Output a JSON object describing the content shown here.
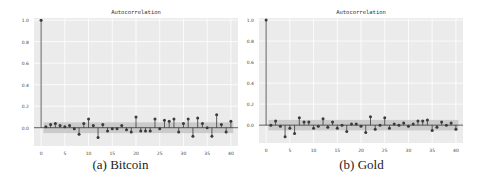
{
  "figure": {
    "captions": [
      "(a) Bitcoin",
      "(b) Gold"
    ]
  },
  "chart_data": [
    {
      "type": "stem",
      "title": "Autocorrelation",
      "caption": "(a) Bitcoin",
      "xlabel": "",
      "ylabel": "",
      "xlim": [
        -1.5,
        41.5
      ],
      "ylim": [
        -0.17,
        1.02
      ],
      "xticks": [
        0,
        5,
        10,
        15,
        20,
        25,
        30,
        35,
        40
      ],
      "yticks": [
        0.0,
        0.2,
        0.4,
        0.6,
        0.8,
        1.0
      ],
      "ytick_labels": [
        "0.0",
        "0.2",
        "0.4",
        "0.6",
        "0.8",
        "1.0"
      ],
      "grid": true,
      "confidence_band": [
        -0.05,
        0.05
      ],
      "x": [
        0,
        1,
        2,
        3,
        4,
        5,
        6,
        7,
        8,
        9,
        10,
        11,
        12,
        13,
        14,
        15,
        16,
        17,
        18,
        19,
        20,
        21,
        22,
        23,
        24,
        25,
        26,
        27,
        28,
        29,
        30,
        31,
        32,
        33,
        34,
        35,
        36,
        37,
        38,
        39,
        40
      ],
      "values": [
        1.0,
        0.01,
        0.03,
        0.04,
        0.02,
        0.01,
        0.02,
        -0.01,
        -0.06,
        0.04,
        0.08,
        0.02,
        -0.09,
        0.03,
        -0.03,
        -0.01,
        -0.01,
        0.02,
        -0.02,
        -0.04,
        0.1,
        -0.03,
        -0.03,
        -0.03,
        0.08,
        -0.01,
        0.07,
        0.06,
        0.08,
        -0.04,
        0.04,
        0.08,
        -0.08,
        0.09,
        0.04,
        0.0,
        -0.08,
        0.12,
        0.03,
        -0.04,
        0.06
      ]
    },
    {
      "type": "stem",
      "title": "Autocorrelation",
      "caption": "(b) Gold",
      "xlabel": "",
      "ylabel": "",
      "xlim": [
        -1.5,
        41.5
      ],
      "ylim": [
        -0.17,
        1.02
      ],
      "xticks": [
        0,
        5,
        10,
        15,
        20,
        25,
        30,
        35,
        40
      ],
      "yticks": [
        0.0,
        0.2,
        0.4,
        0.6,
        0.8,
        1.0
      ],
      "ytick_labels": [
        "0.0",
        "0.2",
        "0.4",
        "0.6",
        "0.8",
        "1.0"
      ],
      "grid": true,
      "confidence_band": [
        -0.05,
        0.05
      ],
      "x": [
        0,
        1,
        2,
        3,
        4,
        5,
        6,
        7,
        8,
        9,
        10,
        11,
        12,
        13,
        14,
        15,
        16,
        17,
        18,
        19,
        20,
        21,
        22,
        23,
        24,
        25,
        26,
        27,
        28,
        29,
        30,
        31,
        32,
        33,
        34,
        35,
        36,
        37,
        38,
        39,
        40
      ],
      "values": [
        1.0,
        0.0,
        0.04,
        -0.01,
        -0.11,
        -0.03,
        -0.08,
        0.07,
        0.03,
        0.03,
        -0.03,
        -0.01,
        0.06,
        -0.02,
        0.03,
        -0.03,
        0.0,
        -0.06,
        0.01,
        0.01,
        -0.01,
        -0.07,
        0.08,
        -0.04,
        0.0,
        0.07,
        -0.03,
        0.01,
        0.0,
        0.02,
        -0.01,
        0.01,
        0.04,
        0.04,
        0.05,
        -0.05,
        -0.02,
        0.03,
        0.0,
        0.02,
        -0.04
      ]
    }
  ],
  "style": {
    "plot_bg": "#ebebeb",
    "grid_color": "#ffffff",
    "band_color": "#c8c8c8",
    "stem_color": "#3a3a3a",
    "marker_color": "#3a3a3a",
    "zero_line_color": "#333333",
    "tick_text_color": "#444444"
  }
}
